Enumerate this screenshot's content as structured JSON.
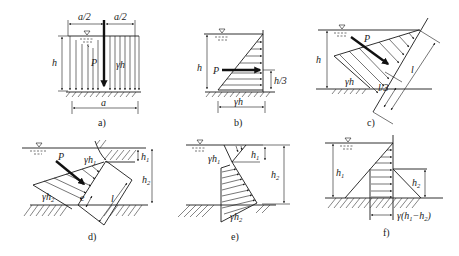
{
  "figure": {
    "panels": [
      {
        "id": "a",
        "caption": "a)",
        "labels": {
          "half_width_left": "a/2",
          "half_width_right": "a/2",
          "depth": "h",
          "force": "P",
          "pressure": "γh",
          "width": "a"
        }
      },
      {
        "id": "b",
        "caption": "b)",
        "labels": {
          "depth": "h",
          "force": "P",
          "arm": "h/3",
          "pressure": "γh"
        }
      },
      {
        "id": "c",
        "caption": "c)",
        "labels": {
          "depth": "h",
          "force": "P",
          "pressure": "γh",
          "arm": "l/3",
          "length": "l"
        }
      },
      {
        "id": "d",
        "caption": "d)",
        "labels": {
          "h1": "h",
          "h1_sub": "1",
          "h2": "h",
          "h2_sub": "2",
          "force": "P",
          "p1": "γh",
          "p1_sub": "1",
          "p2": "γh",
          "p2_sub": "2",
          "ecc": "e",
          "length": "l"
        }
      },
      {
        "id": "e",
        "caption": "e)",
        "labels": {
          "h1": "h",
          "h1_sub": "1",
          "h2": "h",
          "h2_sub": "2",
          "p1": "γh",
          "p1_sub": "1",
          "p2": "γh",
          "p2_sub": "2"
        }
      },
      {
        "id": "f",
        "caption": "f)",
        "labels": {
          "h1": "h",
          "h1_sub": "1",
          "h2": "h",
          "h2_sub": "2",
          "diff": "γ(h",
          "diff_sub1": "1",
          "diff_mid": "−h",
          "diff_sub2": "2",
          "diff_end": ")"
        }
      }
    ]
  }
}
